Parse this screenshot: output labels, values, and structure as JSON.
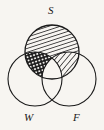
{
  "figure": {
    "type": "venn-diagram",
    "set_count": 3,
    "background_color": "#f7f5f1",
    "stroke_color": "#1a1a1a",
    "fill_color": "#1a1a1a",
    "width": 104,
    "height": 130
  },
  "labels": {
    "s": "S",
    "w": "W",
    "f": "F"
  },
  "circles": [
    {
      "name": "S",
      "label": "S",
      "cx": 52,
      "cy": 52,
      "r": 27,
      "position": "top",
      "fill_pattern": "diagonal-hatch"
    },
    {
      "name": "W",
      "label": "W",
      "cx": 35,
      "cy": 79,
      "r": 27,
      "position": "bottom-left",
      "fill_pattern": "none"
    },
    {
      "name": "F",
      "label": "F",
      "cx": 69,
      "cy": 79,
      "r": 27,
      "position": "bottom-right",
      "fill_pattern": "none"
    }
  ],
  "regions": [
    {
      "name": "S-only",
      "sets": [
        "S"
      ],
      "shading": "diagonal-hatch-dense"
    },
    {
      "name": "S-and-W",
      "sets": [
        "S",
        "W"
      ],
      "shading": "cross-hatch-checkered"
    },
    {
      "name": "S-and-F",
      "sets": [
        "S",
        "F"
      ],
      "shading": "diagonal-hatch-sparse"
    },
    {
      "name": "S-and-W-and-F",
      "sets": [
        "S",
        "W",
        "F"
      ],
      "shading": "none"
    },
    {
      "name": "W-only",
      "sets": [
        "W"
      ],
      "shading": "none"
    },
    {
      "name": "F-only",
      "sets": [
        "F"
      ],
      "shading": "none"
    },
    {
      "name": "W-and-F",
      "sets": [
        "W",
        "F"
      ],
      "shading": "none"
    }
  ],
  "label_positions": {
    "s": {
      "x": 48,
      "y": 5
    },
    "w": {
      "x": 24,
      "y": 112
    },
    "f": {
      "x": 73,
      "y": 112
    }
  }
}
